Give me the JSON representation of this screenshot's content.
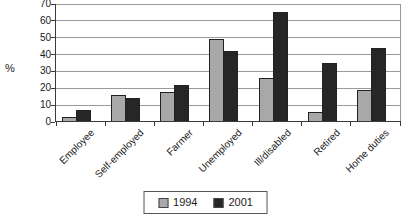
{
  "chart_data": {
    "type": "bar",
    "title": "",
    "xlabel": "",
    "ylabel": "%",
    "ylim": [
      0,
      70
    ],
    "ytick_step": 10,
    "grid": true,
    "legend_position": "bottom-center",
    "categories": [
      "Employee",
      "Self-employed",
      "Farmer",
      "Unemployed",
      "Ill/disabled",
      "Retired",
      "Home duties"
    ],
    "series": [
      {
        "name": "1994",
        "color": "#a8a8a8",
        "values": [
          3,
          16,
          18,
          49,
          26,
          6,
          19
        ]
      },
      {
        "name": "2001",
        "color": "#262626",
        "values": [
          7,
          14,
          22,
          42,
          65,
          35,
          44
        ]
      }
    ]
  }
}
